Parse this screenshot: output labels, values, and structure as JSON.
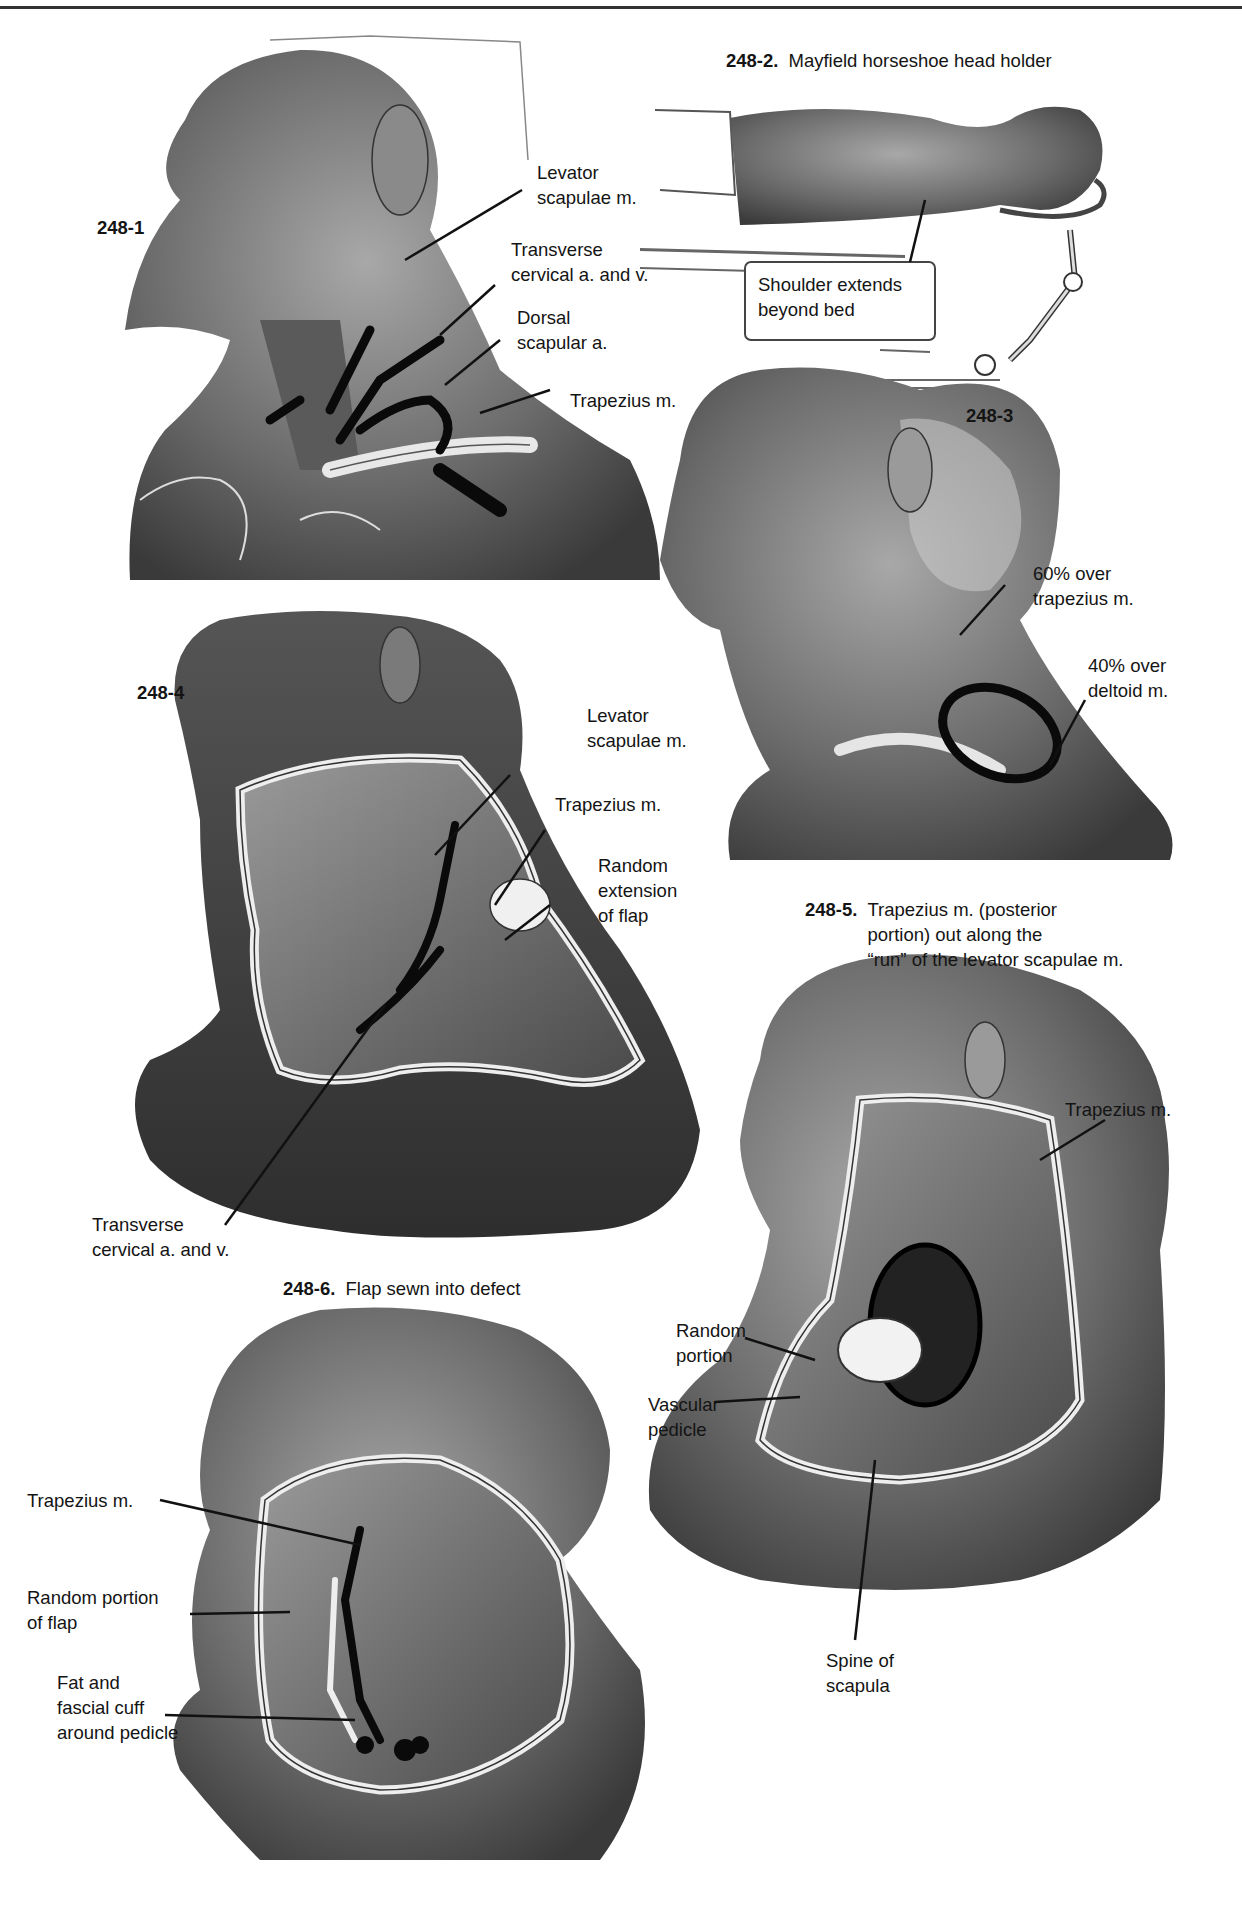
{
  "figures": {
    "f1": {
      "number": "248-1",
      "labels": {
        "levator": "Levator\nscapulae m.",
        "transverse": "Transverse\ncervical a. and v.",
        "dorsal": "Dorsal\nscapular a.",
        "trapezius": "Trapezius m."
      }
    },
    "f2": {
      "number": "248-2.",
      "caption": "Mayfield horseshoe head holder",
      "labels": {
        "shoulder": "Shoulder extends\nbeyond bed"
      }
    },
    "f3": {
      "number": "248-3",
      "labels": {
        "trap60": "60% over\ntrapezius m.",
        "delt40": "40% over\ndeltoid m."
      }
    },
    "f4": {
      "number": "248-4",
      "labels": {
        "levator": "Levator\nscapulae m.",
        "trapezius": "Trapezius m.",
        "random": "Random\nextension\nof flap",
        "transverse": "Transverse\ncervical a. and v."
      }
    },
    "f5": {
      "number": "248-5.",
      "caption": "Trapezius m. (posterior\nportion) out along the\n“run” of the levator scapulae m.",
      "labels": {
        "trapezius": "Trapezius m.",
        "random": "Random\nportion",
        "vascular": "Vascular\npedicle",
        "spine": "Spine of\nscapula"
      }
    },
    "f6": {
      "number": "248-6.",
      "caption": "Flap sewn into defect",
      "labels": {
        "trapezius": "Trapezius m.",
        "random": "Random portion\nof flap",
        "fat": "Fat and\nfascial cuff\naround pedicle"
      }
    }
  },
  "colors": {
    "ink": "#141414",
    "shade_dark": "#3a3a3a",
    "shade_mid": "#7a7a7a",
    "shade_light": "#c8c8c8"
  }
}
